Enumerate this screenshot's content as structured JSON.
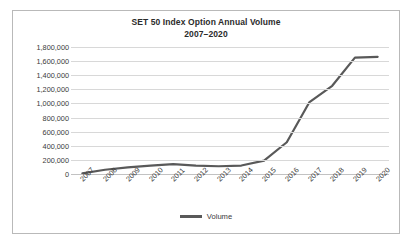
{
  "chart_data": {
    "type": "line",
    "title": "SET 50 Index Option Annual Volume",
    "subtitle": "2007–2020",
    "xlabel": "",
    "ylabel": "",
    "categories": [
      "2007",
      "2008",
      "2009",
      "2010",
      "2011",
      "2012",
      "2013",
      "2014",
      "2015",
      "2016",
      "2017",
      "2018",
      "2019",
      "2020"
    ],
    "series": [
      {
        "name": "Volume",
        "color": "#595959",
        "values": [
          10000,
          60000,
          95000,
          120000,
          140000,
          120000,
          110000,
          120000,
          190000,
          450000,
          1020000,
          1250000,
          1650000,
          1660000
        ]
      }
    ],
    "ylim": [
      0,
      1800000
    ],
    "ytick_labels": [
      "1,800,000",
      "1,600,000",
      "1,400,000",
      "1,200,000",
      "1,000,000",
      "800,000",
      "600,000",
      "400,000",
      "200,000",
      "0"
    ],
    "ytick_values": [
      1800000,
      1600000,
      1400000,
      1200000,
      1000000,
      800000,
      600000,
      400000,
      200000,
      0
    ],
    "grid": true,
    "legend_position": "bottom"
  },
  "legend": {
    "label": "Volume"
  },
  "style": {
    "line_color": "#595959",
    "grid_color": "#d8d8d8",
    "border_color": "#b9b9b9",
    "text_color": "#3a3a3a"
  }
}
